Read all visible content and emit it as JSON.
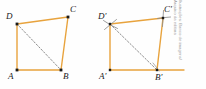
{
  "figure": {
    "colors": {
      "side_stroke": "#e8a33d",
      "diagonal_stroke": "#8c8c8c",
      "vertex_dot": "#1a1a1a",
      "arc_mark": "#8c8c8c",
      "label_text": "#1a1a1a",
      "credit_text": "#9a9a9a",
      "background": "#fefefe"
    },
    "left_shape": {
      "name": "ABCD",
      "vertices": [
        {
          "id": "A",
          "label": "A",
          "x": 17,
          "y": 70,
          "label_x": 8,
          "label_y": 72
        },
        {
          "id": "B",
          "label": "B",
          "x": 61,
          "y": 70,
          "label_x": 63,
          "label_y": 72
        },
        {
          "id": "C",
          "label": "C",
          "x": 68,
          "y": 17,
          "label_x": 70,
          "label_y": 5
        },
        {
          "id": "D",
          "label": "D",
          "x": 17,
          "y": 24,
          "label_x": 7,
          "label_y": 12
        }
      ],
      "sides": [
        "A-B",
        "B-C",
        "C-D",
        "D-A"
      ],
      "diagonal": {
        "from": "D",
        "to": "B",
        "style": "dashed"
      }
    },
    "right_shape": {
      "name": "A'B'C'D'",
      "vertices": [
        {
          "id": "A'",
          "label": "A'",
          "x": 110,
          "y": 70,
          "label_x": 100,
          "label_y": 72
        },
        {
          "id": "B'",
          "label": "B'",
          "x": 157,
          "y": 70,
          "label_x": 156,
          "label_y": 73
        },
        {
          "id": "C'",
          "label": "C'",
          "x": 163,
          "y": 18,
          "label_x": 164,
          "label_y": 5
        },
        {
          "id": "D'",
          "label": "D'",
          "x": 110,
          "y": 24,
          "label_x": 99,
          "label_y": 12
        }
      ],
      "sides": [
        "A'-B'",
        "B'-C'",
        "C'-D'",
        "D'-A'"
      ],
      "diagonal": {
        "from": "D'",
        "to": "B'",
        "style": "dashed"
      },
      "baseline_extension": {
        "from_x": 110,
        "to_x": 184,
        "y": 70
      },
      "construction_arcs": [
        "at-D-prime",
        "at-C-prime"
      ]
    }
  },
  "credit": {
    "line1": "Ilustrações: Banco de imagens/",
    "line2": "Arquivo da editora"
  }
}
